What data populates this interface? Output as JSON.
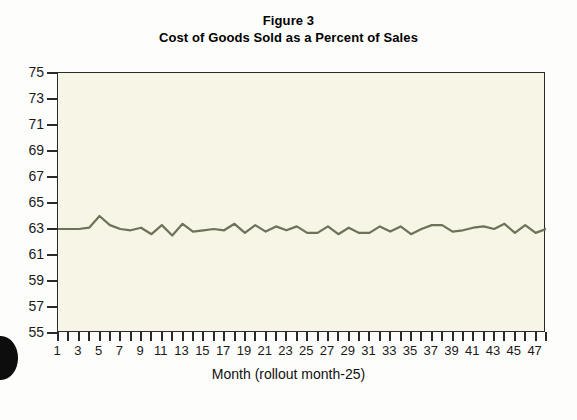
{
  "figure": {
    "title_line1": "Figure 3",
    "title_line2": "Cost of Goods Sold as a Percent of Sales",
    "xlabel": "Month (rollout month-25)"
  },
  "colors": {
    "plot_background": "#f7f5e6",
    "axis": "#2a2a2a",
    "series_line": "#6e7258",
    "page_background": "#fdfdfb",
    "text": "#111111"
  },
  "chart_data": {
    "type": "line",
    "xlabel": "Month (rollout month-25)",
    "ylabel": "",
    "xlim": [
      1,
      48
    ],
    "ylim": [
      55,
      75
    ],
    "grid": false,
    "legend": "none",
    "y_ticks": [
      55,
      57,
      59,
      61,
      63,
      65,
      67,
      69,
      71,
      73,
      75
    ],
    "x_ticks": [
      1,
      3,
      5,
      7,
      9,
      11,
      13,
      15,
      17,
      19,
      21,
      23,
      25,
      27,
      29,
      31,
      33,
      35,
      37,
      39,
      41,
      43,
      45,
      47
    ],
    "x_tick_labels": [
      "1",
      "3",
      "5",
      "7",
      "9",
      "11",
      "13",
      "15",
      "17",
      "19",
      "21",
      "23",
      "25",
      "27",
      "29",
      "31",
      "33",
      "35",
      "37",
      "39",
      "41",
      "43",
      "45",
      "47"
    ],
    "series": [
      {
        "name": "Cost of Goods Sold as a Percent of Sales",
        "x": [
          1,
          2,
          3,
          4,
          5,
          6,
          7,
          8,
          9,
          10,
          11,
          12,
          13,
          14,
          15,
          16,
          17,
          18,
          19,
          20,
          21,
          22,
          23,
          24,
          25,
          26,
          27,
          28,
          29,
          30,
          31,
          32,
          33,
          34,
          35,
          36,
          37,
          38,
          39,
          40,
          41,
          42,
          43,
          44,
          45,
          46,
          47,
          48
        ],
        "values": [
          63.0,
          63.0,
          63.0,
          63.1,
          64.0,
          63.3,
          63.0,
          62.9,
          63.1,
          62.6,
          63.3,
          62.5,
          63.4,
          62.8,
          62.9,
          63.0,
          62.9,
          63.4,
          62.7,
          63.3,
          62.8,
          63.2,
          62.9,
          63.2,
          62.7,
          62.7,
          63.2,
          62.6,
          63.1,
          62.7,
          62.7,
          63.2,
          62.8,
          63.2,
          62.6,
          63.0,
          63.3,
          63.3,
          62.8,
          62.9,
          63.1,
          63.2,
          63.0,
          63.4,
          62.7,
          63.3,
          62.7,
          63.0
        ]
      }
    ]
  }
}
